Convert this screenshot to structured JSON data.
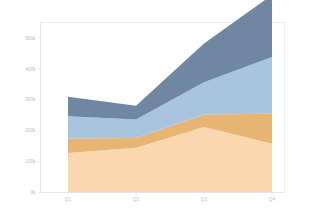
{
  "chart_data": {
    "type": "area",
    "stacked": true,
    "title": "",
    "subtitle": "",
    "xlabel": "",
    "ylabel": "",
    "categories": [
      "Q1",
      "Q2",
      "Q3",
      "Q4"
    ],
    "x_tick_labels": [
      "Q1",
      "Q2",
      "Q3",
      "Q4"
    ],
    "y_tick_labels": [
      "0k",
      "100k",
      "200k",
      "300k",
      "400k",
      "500k"
    ],
    "y_tick_values": [
      0,
      100000,
      200000,
      300000,
      400000,
      500000
    ],
    "ylim": [
      0,
      550000
    ],
    "grid": false,
    "legend": "none",
    "series": [
      {
        "name": "series-1",
        "color": "#fad7ae",
        "values": [
          128000,
          145000,
          212000,
          158000
        ]
      },
      {
        "name": "series-2",
        "color": "#e8b473",
        "values": [
          47000,
          31000,
          40000,
          97000
        ]
      },
      {
        "name": "series-3",
        "color": "#a9c5de",
        "values": [
          72000,
          60000,
          105000,
          183000
        ]
      },
      {
        "name": "series-4",
        "color": "#6f87a3",
        "values": [
          63000,
          45000,
          125000,
          201000
        ]
      }
    ],
    "stacked_totals": [
      310000,
      281000,
      482000,
      639000
    ]
  },
  "colors": {
    "background": "#ffffff",
    "plot_border": "#e9eaec",
    "axis": "#e2e3e6",
    "tick_text": "#b9bcc2",
    "band_1": "#fad7ae",
    "band_2": "#e8b473",
    "band_3": "#a9c5de",
    "band_4": "#6f87a3"
  }
}
